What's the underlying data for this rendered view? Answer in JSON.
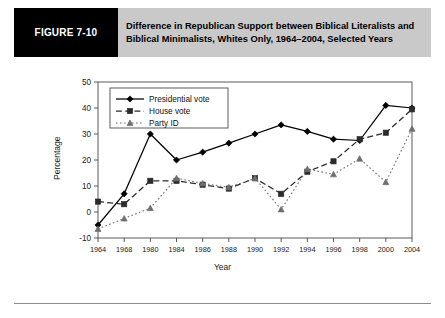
{
  "header": {
    "figure_number": "FIGURE 7-10",
    "title": "Difference in Republican Support between Biblical Literalists and Biblical Minimalists, Whites Only, 1964–2004, Selected Years",
    "badge_color": "#000000",
    "banner_color": "#c9c9c9"
  },
  "chart_data": {
    "type": "line",
    "title": "",
    "xlabel": "Year",
    "ylabel": "Percentage",
    "categories": [
      "1964",
      "1968",
      "1980",
      "1984",
      "1986",
      "1988",
      "1990",
      "1992",
      "1994",
      "1996",
      "1998",
      "2000",
      "2004"
    ],
    "ylim": [
      -10,
      50
    ],
    "yticks": [
      -10,
      0,
      10,
      20,
      30,
      40,
      50
    ],
    "grid": false,
    "legend_position": "top-left",
    "series": [
      {
        "name": "Presidential vote",
        "marker": "diamond",
        "line_style": "solid",
        "color": "#000000",
        "values": [
          -5,
          7,
          30,
          20,
          23,
          26.5,
          30,
          33.5,
          31,
          28,
          27.5,
          41,
          40
        ]
      },
      {
        "name": "House vote",
        "marker": "square",
        "line_style": "dashed",
        "color": "#2b2b2b",
        "values": [
          4,
          3,
          12,
          12,
          10.5,
          9,
          13,
          7,
          15.5,
          19.5,
          28,
          30.5,
          39.5
        ]
      },
      {
        "name": "Party ID",
        "marker": "triangle",
        "line_style": "dotted",
        "color": "#6f6f6f",
        "values": [
          -6.5,
          -2.5,
          1.5,
          13,
          11,
          9.5,
          13,
          1,
          16.5,
          14.5,
          20.5,
          11.5,
          32
        ]
      }
    ]
  }
}
